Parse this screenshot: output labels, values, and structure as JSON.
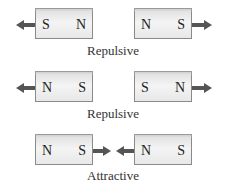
{
  "rows": [
    {
      "left_magnet": {
        "left_pole": "S",
        "right_pole": "N"
      },
      "right_magnet": {
        "left_pole": "N",
        "right_pole": "S"
      },
      "label": "Repulsive",
      "arrows": "outward"
    },
    {
      "left_magnet": {
        "left_pole": "N",
        "right_pole": "S"
      },
      "right_magnet": {
        "left_pole": "S",
        "right_pole": "N"
      },
      "label": "Repulsive",
      "arrows": "outward"
    },
    {
      "left_magnet": {
        "left_pole": "N",
        "right_pole": "S"
      },
      "right_magnet": {
        "left_pole": "N",
        "right_pole": "S"
      },
      "label": "Attractive",
      "arrows": "inward"
    }
  ],
  "colors": {
    "arrow": "#555555",
    "magnet_border": "#8a8a8a",
    "text": "#222222"
  }
}
